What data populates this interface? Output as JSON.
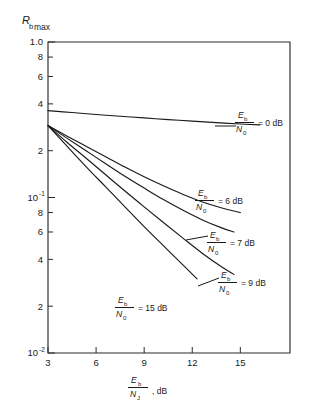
{
  "figure": {
    "background": "#ffffff",
    "ink_color": "#1a1a1a"
  },
  "axes": {
    "y_title_main": "R",
    "y_title_sub1": "b",
    "y_title_sub2": "max",
    "x_title_num": "E",
    "x_title_num_sub": "b",
    "x_title_den": "N",
    "x_title_den_sub": "J",
    "x_title_unit": ", dB",
    "y_ticklabels": [
      "1.0",
      "8",
      "6",
      "4",
      "2",
      "10",
      "8",
      "6",
      "4",
      "2",
      "10"
    ],
    "y_exp_upper": "-1",
    "y_exp_lower": "-2",
    "x_ticklabels": [
      "3",
      "6",
      "9",
      "12",
      "15"
    ]
  },
  "annotations": [
    {
      "id": "a0",
      "num": "E",
      "num_sub": "b",
      "den": "N",
      "den_sub": "0",
      "eq": "= 0 dB"
    },
    {
      "id": "a6",
      "num": "E",
      "num_sub": "b",
      "den": "N",
      "den_sub": "0",
      "eq": "= 6 dB"
    },
    {
      "id": "a7",
      "num": "E",
      "num_sub": "b",
      "den": "N",
      "den_sub": "0",
      "eq": "= 7 dB"
    },
    {
      "id": "a9",
      "num": "E",
      "num_sub": "b",
      "den": "N",
      "den_sub": "0",
      "eq": "= 9 dB"
    },
    {
      "id": "a15",
      "num": "E",
      "num_sub": "b",
      "den": "N",
      "den_sub": "0",
      "eq": "= 15 dB"
    }
  ],
  "chart_data": {
    "type": "line",
    "title": "",
    "xlabel": "Eb/NJ , dB",
    "ylabel": "Rb max",
    "xscale": "linear",
    "yscale": "log",
    "xlim": [
      3,
      18.1
    ],
    "ylim": [
      0.01,
      1.0
    ],
    "grid": false,
    "legend_position": "inline-annotations",
    "x_ticks": [
      3,
      6,
      9,
      12,
      15
    ],
    "y_ticks": [
      1.0,
      0.8,
      0.6,
      0.4,
      0.2,
      0.1,
      0.08,
      0.06,
      0.04,
      0.02,
      0.01
    ],
    "y_tick_labels": [
      "1.0",
      "8",
      "6",
      "4",
      "2",
      "10^-1",
      "8",
      "6",
      "4",
      "2",
      "10^-2"
    ],
    "series": [
      {
        "name": "Eb/N0 = 0 dB",
        "x": [
          3,
          4.5,
          6,
          7.5,
          9,
          10.5,
          12,
          13.5,
          15,
          16.2
        ],
        "y": [
          0.362,
          0.352,
          0.342,
          0.333,
          0.325,
          0.317,
          0.31,
          0.303,
          0.297,
          0.293
        ]
      },
      {
        "name": "Eb/N0 = 6 dB",
        "x": [
          3,
          4.2,
          5.4,
          6.6,
          7.8,
          9,
          10.2,
          11.4,
          12.6,
          13.8,
          15
        ],
        "y": [
          0.29,
          0.248,
          0.213,
          0.183,
          0.157,
          0.136,
          0.119,
          0.105,
          0.094,
          0.086,
          0.08
        ]
      },
      {
        "name": "Eb/N0 = 7 dB",
        "x": [
          3,
          4.2,
          5.4,
          6.6,
          7.8,
          9,
          10.2,
          11.4,
          12.6,
          13.8,
          14.6
        ],
        "y": [
          0.29,
          0.24,
          0.199,
          0.165,
          0.137,
          0.115,
          0.097,
          0.083,
          0.072,
          0.064,
          0.06
        ]
      },
      {
        "name": "Eb/N0 = 9 dB",
        "x": [
          3,
          4.2,
          5.4,
          6.6,
          7.8,
          9,
          10.2,
          11.4,
          12.6,
          13.8,
          14.6
        ],
        "y": [
          0.29,
          0.226,
          0.178,
          0.14,
          0.11,
          0.087,
          0.069,
          0.055,
          0.044,
          0.036,
          0.032
        ]
      },
      {
        "name": "Eb/N0 = 15 dB",
        "x": [
          3,
          4.2,
          5.4,
          6.6,
          7.8,
          9,
          10.2,
          11.4,
          12.3
        ],
        "y": [
          0.29,
          0.213,
          0.157,
          0.117,
          0.087,
          0.065,
          0.049,
          0.037,
          0.03
        ]
      }
    ]
  }
}
